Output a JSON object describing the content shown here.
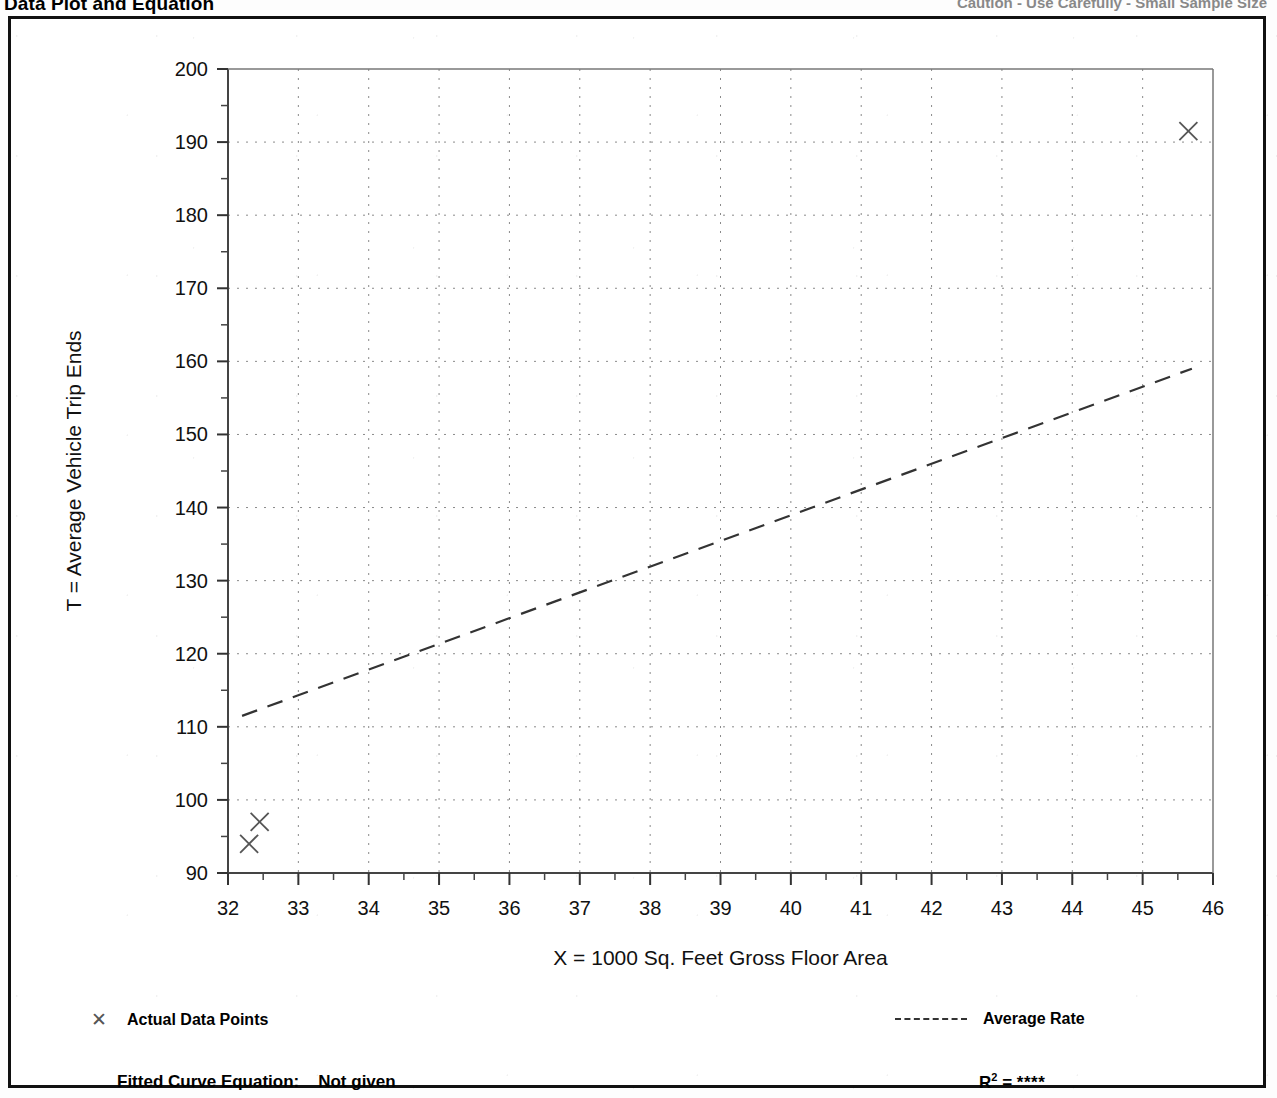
{
  "header": {
    "title": "Data Plot and Equation",
    "right_text": "Caution - Use Carefully - Small Sample Size"
  },
  "legend": {
    "data_points_marker": "x-marker-icon",
    "data_points_label": "Actual Data Points",
    "average_rate_marker": "dashed-line-icon",
    "average_rate_label": "Average Rate"
  },
  "equation": {
    "label": "Fitted Curve Equation:",
    "value": "Not given",
    "r2_label": "R",
    "r2_exponent": "2",
    "r2_equals": "=",
    "r2_value": "****"
  },
  "chart_data": {
    "type": "scatter",
    "title": "",
    "xlabel": "X = 1000 Sq. Feet Gross Floor Area",
    "ylabel": "T = Average Vehicle Trip Ends",
    "xlim": [
      32,
      46
    ],
    "ylim": [
      90,
      200
    ],
    "xticks": [
      32,
      33,
      34,
      35,
      36,
      37,
      38,
      39,
      40,
      41,
      42,
      43,
      44,
      45,
      46
    ],
    "yticks": [
      90,
      100,
      110,
      120,
      130,
      140,
      150,
      160,
      170,
      180,
      190,
      200
    ],
    "x_minor_step": 0.5,
    "y_minor_step": 5,
    "grid": true,
    "grid_style": "dotted",
    "legend_position": "below-plot",
    "series": [
      {
        "name": "Actual Data Points",
        "type": "scatter",
        "marker": "x",
        "color": "#555555",
        "points": [
          {
            "x": 32.3,
            "y": 94.0
          },
          {
            "x": 32.45,
            "y": 97.0
          },
          {
            "x": 45.65,
            "y": 191.5
          }
        ]
      },
      {
        "name": "Average Rate",
        "type": "line",
        "style": "dashed",
        "color": "#333333",
        "points": [
          {
            "x": 32.2,
            "y": 111.5
          },
          {
            "x": 45.7,
            "y": 159.0
          }
        ]
      }
    ]
  }
}
